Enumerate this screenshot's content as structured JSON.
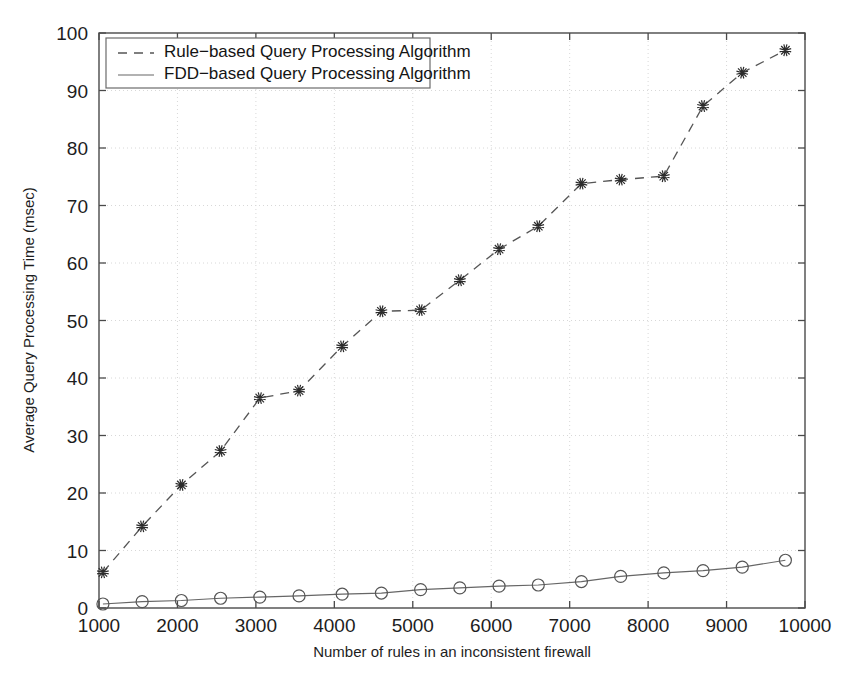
{
  "chart_data": {
    "type": "line",
    "title": "",
    "xlabel": "Number of rules in an inconsistent firewall",
    "ylabel": "Average Query Processing Time (msec)",
    "xlim": [
      1000,
      10000
    ],
    "ylim": [
      0,
      100
    ],
    "xticks": [
      1000,
      2000,
      3000,
      4000,
      5000,
      6000,
      7000,
      8000,
      9000,
      10000
    ],
    "yticks": [
      0,
      10,
      20,
      30,
      40,
      50,
      60,
      70,
      80,
      90,
      100
    ],
    "xtick_labels": [
      "1000",
      "2000",
      "3000",
      "4000",
      "5000",
      "6000",
      "7000",
      "8000",
      "9000",
      "10000"
    ],
    "ytick_labels": [
      "0",
      "10",
      "20",
      "30",
      "40",
      "50",
      "60",
      "70",
      "80",
      "90",
      "100"
    ],
    "grid": true,
    "grid_style": "dotted",
    "legend_position": "top-left",
    "series": [
      {
        "name": "Rule−based Query Processing Algorithm",
        "marker": "star",
        "linestyle": "dashed",
        "color": "#555555",
        "x": [
          1050,
          1550,
          2050,
          2550,
          3050,
          3550,
          4100,
          4600,
          5100,
          5600,
          6100,
          6600,
          7150,
          7650,
          8200,
          8700,
          9200,
          9750
        ],
        "values": [
          6.2,
          14.2,
          21.4,
          27.3,
          36.5,
          37.8,
          45.5,
          51.6,
          51.8,
          57.0,
          62.4,
          66.4,
          73.8,
          74.5,
          75.1,
          87.3,
          93.1,
          97.0
        ]
      },
      {
        "name": "FDD−based Query Processing Algorithm",
        "marker": "circle",
        "linestyle": "solid",
        "color": "#666666",
        "x": [
          1050,
          1550,
          2050,
          2550,
          3050,
          3550,
          4100,
          4600,
          5100,
          5600,
          6100,
          6600,
          7150,
          7650,
          8200,
          8700,
          9200,
          9750
        ],
        "values": [
          0.7,
          1.1,
          1.3,
          1.7,
          1.9,
          2.1,
          2.4,
          2.6,
          3.2,
          3.5,
          3.8,
          4.0,
          4.6,
          5.5,
          6.1,
          6.5,
          7.1,
          8.3
        ]
      }
    ]
  },
  "legend": {
    "entries": [
      {
        "label": "Rule−based Query Processing Algorithm",
        "style": "dashed"
      },
      {
        "label": "FDD−based Query Processing Algorithm",
        "style": "solid"
      }
    ]
  }
}
